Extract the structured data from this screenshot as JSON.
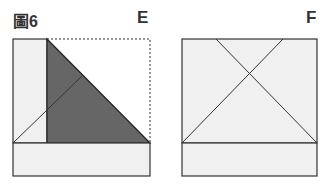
{
  "figure": {
    "label": "圖6",
    "panels": [
      {
        "label": "E",
        "description": "Folded square with left strip, shaded triangle and dashed outline of original square"
      },
      {
        "label": "F",
        "description": "Square with bottom strip and X-shaped crease lines"
      }
    ]
  },
  "colors": {
    "stroke": "#333333",
    "fill_light": "#f0f0f0",
    "shaded": "#666666",
    "background": "#ffffff"
  }
}
